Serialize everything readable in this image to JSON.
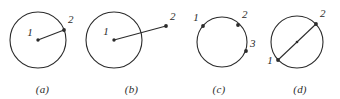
{
  "figure": {
    "background_color": "#ffffff",
    "ink_color": "#2b2b2b",
    "panels": [
      {
        "caption": "(a)",
        "description": "circle with radius drawn from center point 1 to point 2 on the circle",
        "circle": {
          "cx": 38,
          "cy": 40,
          "r": 28
        },
        "segment": {
          "x1": 38,
          "y1": 40,
          "x2": 64,
          "y2": 30
        },
        "points": [
          {
            "label": "1",
            "x": 38,
            "y": 40,
            "label_x": 30,
            "label_y": 36
          },
          {
            "label": "2",
            "x": 64,
            "y": 30,
            "label_x": 68,
            "label_y": 23
          }
        ]
      },
      {
        "caption": "(b)",
        "description": "circle with a ray from center point 1 extending past the circle to external point 2",
        "circle": {
          "cx": 114,
          "cy": 40,
          "r": 28
        },
        "segment": {
          "x1": 114,
          "y1": 40,
          "x2": 166,
          "y2": 26
        },
        "points": [
          {
            "label": "1",
            "x": 114,
            "y": 40,
            "label_x": 106,
            "label_y": 35
          },
          {
            "label": "2",
            "x": 166,
            "y": 26,
            "label_x": 170,
            "label_y": 20
          }
        ]
      },
      {
        "caption": "(c)",
        "description": "circle with three marked points 1, 2 and 3 on the circumference",
        "circle": {
          "cx": 222,
          "cy": 42,
          "r": 25
        },
        "segment": null,
        "points": [
          {
            "label": "1",
            "x": 203,
            "y": 26,
            "label_x": 196,
            "label_y": 21
          },
          {
            "label": "2",
            "x": 238,
            "y": 25,
            "label_x": 242,
            "label_y": 18
          },
          {
            "label": "3",
            "x": 246,
            "y": 51,
            "label_x": 250,
            "label_y": 47
          }
        ]
      },
      {
        "caption": "(d)",
        "description": "circle with a diameter drawn from point 1 to point 2 through the center",
        "circle": {
          "cx": 297,
          "cy": 42,
          "r": 26
        },
        "segment": {
          "x1": 278,
          "y1": 60,
          "x2": 316,
          "y2": 24
        },
        "points": [
          {
            "label": "1",
            "x": 278,
            "y": 60,
            "label_x": 270,
            "label_y": 62
          },
          {
            "label": "2",
            "x": 316,
            "y": 24,
            "label_x": 320,
            "label_y": 17
          },
          {
            "label": "",
            "x": 297,
            "y": 42,
            "label_x": 297,
            "label_y": 42
          }
        ]
      }
    ]
  }
}
